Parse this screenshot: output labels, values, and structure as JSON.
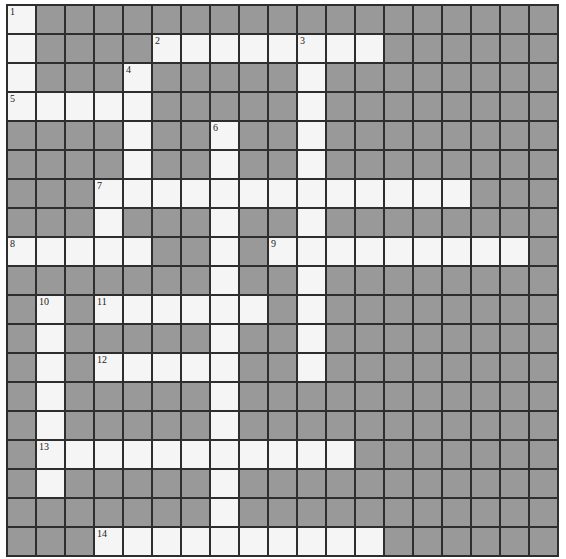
{
  "puzzle": {
    "rows": 19,
    "cols": 19,
    "colors": {
      "block": "#999999",
      "open": "#f5f5f5",
      "line": "#2e2e2e"
    },
    "across": [
      {
        "number": "2",
        "row": 1,
        "col": 5,
        "length": 8
      },
      {
        "number": "5",
        "row": 3,
        "col": 0,
        "length": 5
      },
      {
        "number": "7",
        "row": 6,
        "col": 3,
        "length": 13
      },
      {
        "number": "8",
        "row": 8,
        "col": 0,
        "length": 5
      },
      {
        "number": "9",
        "row": 8,
        "col": 9,
        "length": 9
      },
      {
        "number": "11",
        "row": 10,
        "col": 3,
        "length": 6
      },
      {
        "number": "12",
        "row": 12,
        "col": 3,
        "length": 5
      },
      {
        "number": "13",
        "row": 15,
        "col": 1,
        "length": 11
      },
      {
        "number": "14",
        "row": 18,
        "col": 3,
        "length": 10
      }
    ],
    "down": [
      {
        "number": "1",
        "row": 0,
        "col": 0,
        "length": 4
      },
      {
        "number": "3",
        "row": 1,
        "col": 10,
        "length": 12
      },
      {
        "number": "4",
        "row": 2,
        "col": 4,
        "length": 5
      },
      {
        "number": "6",
        "row": 4,
        "col": 7,
        "length": 15
      },
      {
        "number": "7d",
        "row": 6,
        "col": 3,
        "length": 3
      },
      {
        "number": "10",
        "row": 10,
        "col": 1,
        "length": 7
      }
    ]
  }
}
